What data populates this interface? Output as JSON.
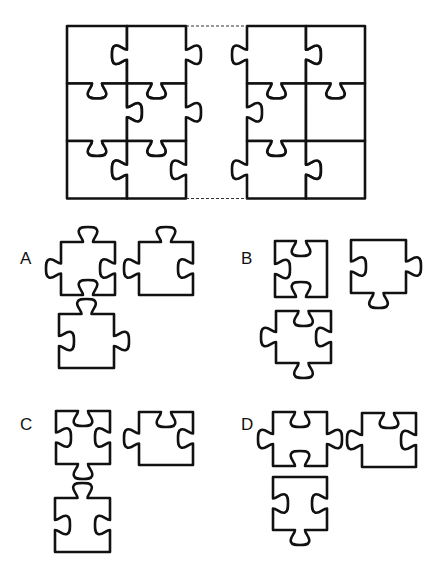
{
  "puzzle": {
    "description": "Jigsaw puzzle with a missing middle column; choose the set of three pieces that completes it",
    "main_grid": {
      "left_block": {
        "rows": 3,
        "cols": 2,
        "cells": [
          [
            {
              "top": "flat",
              "right": "blank",
              "bottom": "tab",
              "left": "flat"
            },
            {
              "top": "flat",
              "right": "tab",
              "bottom": "tab",
              "left": "tab"
            }
          ],
          [
            {
              "top": "blank",
              "right": "tab",
              "bottom": "tab",
              "left": "flat"
            },
            {
              "top": "blank",
              "right": "tab",
              "bottom": "tab",
              "left": "blank"
            }
          ],
          [
            {
              "top": "blank",
              "right": "blank",
              "bottom": "flat",
              "left": "flat"
            },
            {
              "top": "blank",
              "right": "blank",
              "bottom": "flat",
              "left": "tab"
            }
          ]
        ]
      },
      "missing_column": {
        "rows": 3,
        "marker": "dashed-outline"
      },
      "right_block": {
        "rows": 3,
        "cols": 2,
        "cells": [
          [
            {
              "top": "flat",
              "right": "tab",
              "bottom": "tab",
              "left": "tab"
            },
            {
              "top": "flat",
              "right": "flat",
              "bottom": "tab",
              "left": "blank"
            }
          ],
          [
            {
              "top": "blank",
              "right": "flat",
              "bottom": "tab",
              "left": "blank"
            },
            {
              "top": "blank",
              "right": "flat",
              "bottom": "flat",
              "left": "flat"
            }
          ],
          [
            {
              "top": "blank",
              "right": "tab",
              "bottom": "flat",
              "left": "tab"
            },
            {
              "top": "flat",
              "right": "flat",
              "bottom": "flat",
              "left": "blank"
            }
          ]
        ]
      }
    },
    "options": [
      {
        "label": "A",
        "pieces": [
          {
            "top": "tab",
            "right": "blank",
            "bottom": "blank",
            "left": "tab"
          },
          {
            "top": "tab",
            "right": "blank",
            "bottom": "flat",
            "left": "tab"
          },
          {
            "top": "tab",
            "right": "tab",
            "bottom": "flat",
            "left": "blank"
          }
        ]
      },
      {
        "label": "B",
        "pieces": [
          {
            "top": "blank",
            "right": "flat",
            "bottom": "blank",
            "left": "blank"
          },
          {
            "top": "flat",
            "right": "tab",
            "bottom": "tab",
            "left": "blank"
          },
          {
            "top": "blank",
            "right": "blank",
            "bottom": "tab",
            "left": "tab"
          }
        ]
      },
      {
        "label": "C",
        "pieces": [
          {
            "top": "blank",
            "right": "blank",
            "bottom": "tab",
            "left": "blank"
          },
          {
            "top": "blank",
            "right": "blank",
            "bottom": "flat",
            "left": "tab"
          },
          {
            "top": "tab",
            "right": "blank",
            "bottom": "flat",
            "left": "blank"
          }
        ]
      },
      {
        "label": "D",
        "pieces": [
          {
            "top": "blank",
            "right": "tab",
            "bottom": "blank",
            "left": "tab"
          },
          {
            "top": "blank",
            "right": "blank",
            "bottom": "flat",
            "left": "tab"
          },
          {
            "top": "flat",
            "right": "blank",
            "bottom": "tab",
            "left": "blank"
          }
        ]
      }
    ]
  }
}
